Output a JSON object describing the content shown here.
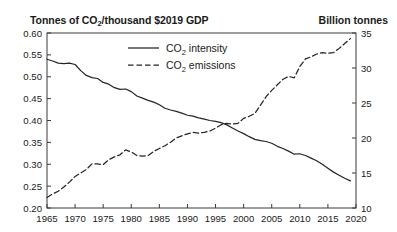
{
  "header": {
    "left_axis_title_pre": "Tonnes of CO",
    "left_axis_title_sub": "2",
    "left_axis_title_post": "/thousand $2019 GDP",
    "right_axis_title": "Billion tonnes"
  },
  "legend": {
    "items": [
      {
        "label_pre": "CO",
        "label_sub": "2",
        "label_post": " intensity",
        "style": "solid"
      },
      {
        "label_pre": "CO",
        "label_sub": "2",
        "label_post": " emissions",
        "style": "dashed"
      }
    ]
  },
  "chart_data": {
    "type": "line",
    "title": "",
    "xlabel": "",
    "ylabel": "Tonnes of CO2/thousand $2019 GDP",
    "y2label": "Billion tonnes",
    "grid": false,
    "legend_position": "top-center",
    "xlim": [
      1965,
      2020
    ],
    "xticks": [
      1965,
      1970,
      1975,
      1980,
      1985,
      1990,
      1995,
      2000,
      2005,
      2010,
      2015,
      2020
    ],
    "xtick_labels": [
      "1965",
      "1970",
      "1975",
      "1980",
      "1985",
      "1990",
      "1995",
      "2000",
      "2005",
      "2010",
      "2015",
      "2020"
    ],
    "ylim": [
      0.2,
      0.6
    ],
    "yticks": [
      0.2,
      0.25,
      0.3,
      0.35,
      0.4,
      0.45,
      0.5,
      0.55,
      0.6
    ],
    "ytick_labels": [
      "0.20",
      "0.25",
      "0.30",
      "0.35",
      "0.40",
      "0.45",
      "0.50",
      "0.55",
      "0.60"
    ],
    "y2lim": [
      10,
      35
    ],
    "y2ticks": [
      10,
      15,
      20,
      25,
      30,
      35
    ],
    "y2tick_labels": [
      "10",
      "15",
      "20",
      "25",
      "30",
      "35"
    ],
    "x": [
      1965,
      1966,
      1967,
      1968,
      1969,
      1970,
      1971,
      1972,
      1973,
      1974,
      1975,
      1976,
      1977,
      1978,
      1979,
      1980,
      1981,
      1982,
      1983,
      1984,
      1985,
      1986,
      1987,
      1988,
      1989,
      1990,
      1991,
      1992,
      1993,
      1994,
      1995,
      1996,
      1997,
      1998,
      1999,
      2000,
      2001,
      2002,
      2003,
      2004,
      2005,
      2006,
      2007,
      2008,
      2009,
      2010,
      2011,
      2012,
      2013,
      2014,
      2015,
      2016,
      2017,
      2018,
      2019
    ],
    "series": [
      {
        "name": "CO2 intensity",
        "axis": "left",
        "style": "solid",
        "units": "Tonnes of CO2/thousand $2019 GDP",
        "values": [
          0.54,
          0.536,
          0.531,
          0.53,
          0.531,
          0.528,
          0.514,
          0.503,
          0.498,
          0.496,
          0.487,
          0.483,
          0.475,
          0.471,
          0.472,
          0.466,
          0.456,
          0.451,
          0.446,
          0.442,
          0.436,
          0.428,
          0.424,
          0.421,
          0.417,
          0.412,
          0.41,
          0.406,
          0.403,
          0.4,
          0.398,
          0.395,
          0.39,
          0.383,
          0.376,
          0.37,
          0.363,
          0.357,
          0.354,
          0.352,
          0.348,
          0.341,
          0.336,
          0.33,
          0.323,
          0.324,
          0.32,
          0.314,
          0.308,
          0.3,
          0.291,
          0.282,
          0.275,
          0.268,
          0.262
        ]
      },
      {
        "name": "CO2 emissions",
        "axis": "right",
        "style": "dashed",
        "units": "Billion tonnes",
        "values": [
          11.5,
          12.0,
          12.4,
          13.0,
          13.7,
          14.5,
          15.0,
          15.5,
          16.3,
          16.3,
          16.2,
          16.9,
          17.3,
          17.6,
          18.3,
          18.0,
          17.5,
          17.4,
          17.5,
          18.1,
          18.5,
          18.9,
          19.4,
          20.0,
          20.3,
          20.6,
          20.8,
          20.7,
          20.8,
          21.0,
          21.4,
          21.9,
          22.1,
          22.0,
          22.1,
          22.8,
          23.1,
          23.5,
          24.7,
          25.9,
          26.8,
          27.6,
          28.4,
          28.8,
          28.6,
          30.2,
          31.3,
          31.6,
          32.0,
          32.2,
          32.1,
          32.2,
          32.8,
          33.5,
          34.2
        ]
      }
    ],
    "crossover_year": 1991
  }
}
